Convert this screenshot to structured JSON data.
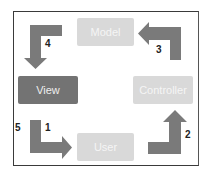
{
  "diagram": {
    "nodes": [
      {
        "id": "model",
        "label": "Model",
        "style": "light"
      },
      {
        "id": "view",
        "label": "View",
        "style": "dark"
      },
      {
        "id": "controller",
        "label": "Controller",
        "style": "light"
      },
      {
        "id": "user",
        "label": "User",
        "style": "light"
      }
    ],
    "edges": [
      {
        "label": "1",
        "from": "view",
        "to": "user"
      },
      {
        "label": "2",
        "from": "user",
        "to": "controller"
      },
      {
        "label": "3",
        "from": "controller",
        "to": "model"
      },
      {
        "label": "4",
        "from": "model",
        "to": "view"
      },
      {
        "label": "5",
        "note": "step beside arrow 1"
      }
    ],
    "colors": {
      "light_box": "#d9d9d9",
      "dark_box": "#737373",
      "arrow": "#7a7a7a",
      "frame": "#3a3a3a"
    }
  }
}
